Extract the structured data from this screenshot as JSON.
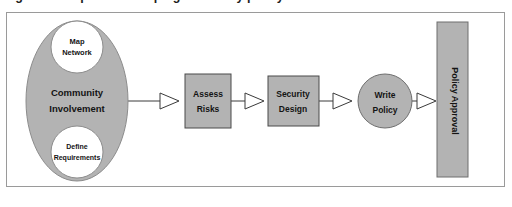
{
  "figure": {
    "caption": "Figure 1. Steps in developing a security policy",
    "frame_border_color": "#9a9a9a",
    "background_color": "#ffffff"
  },
  "style": {
    "node_fill": "#b3b3b3",
    "node_stroke": "#4a4a4a",
    "inner_circle_fill": "#ffffff",
    "connector_color": "#3a3a3a",
    "arrowhead_fill": "#ffffff",
    "label_color": "#141414"
  },
  "diagram": {
    "type": "process-flow",
    "direction": "left-to-right",
    "nodes": [
      {
        "id": "community-involvement",
        "shape": "ellipse",
        "label_line1": "Community",
        "label_line2": "Involvement",
        "fill": "#b3b3b3",
        "children": [
          {
            "id": "map-network",
            "shape": "circle",
            "label_line1": "Map",
            "label_line2": "Network",
            "fill": "#ffffff"
          },
          {
            "id": "define-requirements",
            "shape": "circle",
            "label_line1": "Define",
            "label_line2": "Requirements",
            "fill": "#ffffff"
          }
        ]
      },
      {
        "id": "assess-risks",
        "shape": "rectangle",
        "label_line1": "Assess",
        "label_line2": "Risks",
        "fill": "#b3b3b3"
      },
      {
        "id": "security-design",
        "shape": "rectangle",
        "label_line1": "Security",
        "label_line2": "Design",
        "fill": "#b3b3b3"
      },
      {
        "id": "write-policy",
        "shape": "circle",
        "label_line1": "Write",
        "label_line2": "Policy",
        "fill": "#b3b3b3"
      },
      {
        "id": "policy-approval",
        "shape": "vertical-bar",
        "label_line1": "Policy Approval",
        "orientation": "rotated-90",
        "fill": "#b3b3b3"
      }
    ],
    "connectors": [
      {
        "id": "conn-1",
        "from": "community-involvement",
        "to": "assess-risks",
        "arrowhead": "hollow-triangle"
      },
      {
        "id": "conn-2",
        "from": "assess-risks",
        "to": "security-design",
        "arrowhead": "hollow-triangle"
      },
      {
        "id": "conn-3",
        "from": "security-design",
        "to": "write-policy",
        "arrowhead": "hollow-triangle"
      },
      {
        "id": "conn-4",
        "from": "write-policy",
        "to": "policy-approval",
        "arrowhead": "hollow-triangle"
      }
    ]
  }
}
